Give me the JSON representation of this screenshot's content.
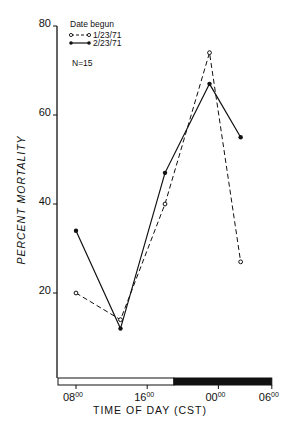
{
  "chart_data": {
    "type": "line",
    "title": "",
    "xlabel": "TIME OF DAY (CST)",
    "ylabel": "PERCENT MORTALITY",
    "ylim": [
      20,
      80
    ],
    "yticks": [
      20,
      40,
      60,
      80
    ],
    "xticks": [
      {
        "hour": 8,
        "label": "08",
        "sup": "00"
      },
      {
        "hour": 16,
        "label": "16",
        "sup": "00"
      },
      {
        "hour": 24,
        "label": "00",
        "sup": "00"
      },
      {
        "hour": 30,
        "label": "06",
        "sup": "00"
      }
    ],
    "legend_title": "Date begun",
    "annotation": "N=15",
    "light_dark_bar": {
      "light_from": 7.7,
      "light_to": 19,
      "dark_from": 19,
      "dark_to": 30
    },
    "grid": false,
    "series": [
      {
        "name": "1/23/71",
        "style": "dashed",
        "marker": "open-circle",
        "x_hours": [
          8,
          13,
          18,
          23,
          26.5
        ],
        "values": [
          20,
          14,
          40,
          74,
          27
        ]
      },
      {
        "name": "2/23/71",
        "style": "solid",
        "marker": "filled-circle",
        "x_hours": [
          8,
          13,
          18,
          23,
          26.5
        ],
        "values": [
          34,
          12,
          47,
          67,
          55
        ]
      }
    ]
  },
  "text": {
    "legend_title": "Date begun",
    "legend_series_1": "1/23/71",
    "legend_series_2": "2/23/71",
    "n_label": "N=15",
    "ylabel": "PERCENT MORTALITY",
    "xlabel": "TIME OF DAY (CST)"
  }
}
